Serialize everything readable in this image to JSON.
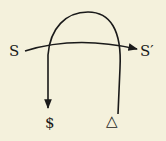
{
  "diagram": {
    "labels": {
      "signifier_start": "S",
      "signifier_end": "S′",
      "barred_subject": "$",
      "delta": "△"
    },
    "colors": {
      "background": "#f4f1dc",
      "ink": "#1a1a1a"
    }
  }
}
